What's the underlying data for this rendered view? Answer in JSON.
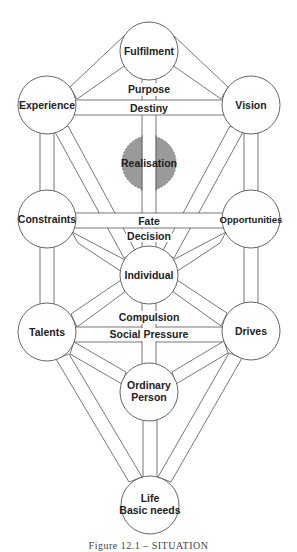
{
  "diagram": {
    "nodes": {
      "fulfilment": {
        "label": "Fulfilment",
        "cx": 149,
        "cy": 51
      },
      "experience": {
        "label": "Experience",
        "cx": 47,
        "cy": 105
      },
      "vision": {
        "label": "Vision",
        "cx": 251,
        "cy": 105
      },
      "realisation": {
        "label": "Realisation",
        "cx": 149,
        "cy": 163
      },
      "constraints": {
        "label": "Constraints",
        "cx": 47,
        "cy": 219
      },
      "opportunities": {
        "label": "Opportunities",
        "cx": 251,
        "cy": 219
      },
      "individual": {
        "label": "Individual",
        "cx": 149,
        "cy": 275
      },
      "talents": {
        "label": "Talents",
        "cx": 47,
        "cy": 332
      },
      "drives": {
        "label": "Drives",
        "cx": 251,
        "cy": 331
      },
      "ordinary_person": {
        "label_line1": "Ordinary",
        "label_line2": "Person",
        "cx": 149,
        "cy": 392
      },
      "life": {
        "label_line1": "Life",
        "label_line2": "Basic needs",
        "cx": 150,
        "cy": 505
      }
    },
    "path_labels": {
      "purpose": "Purpose",
      "destiny": "Destiny",
      "fate": "Fate",
      "decision": "Decision",
      "compulsion": "Compulsion",
      "social_pressure": "Social Pressure"
    },
    "caption": "Figure 12.1 – SITUATION",
    "colors": {
      "stroke": "#555555",
      "realisation_fill": "#9a9a9a",
      "text": "#222222"
    }
  }
}
